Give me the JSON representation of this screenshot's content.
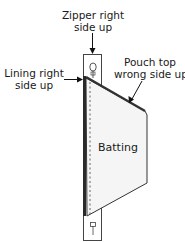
{
  "labels": {
    "zipper": [
      "Zipper right",
      "side up"
    ],
    "lining": [
      "Lining right",
      "side up"
    ],
    "pouch_top": [
      "Pouch top",
      "wrong side up"
    ],
    "batting": "Batting"
  },
  "colors": {
    "outline": "#222222",
    "lining": "#2a2a2a",
    "batting_fill": "#f4f4f4",
    "pouch_edge": "#333333"
  }
}
